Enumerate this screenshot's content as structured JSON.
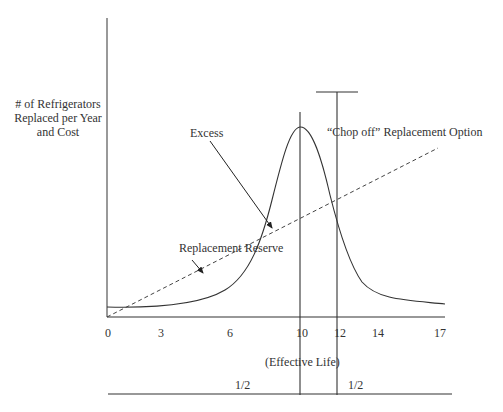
{
  "y_axis_label": {
    "line1": "# of Refrigerators",
    "line2": "Replaced per Year",
    "line3": "and Cost"
  },
  "annotations": {
    "excess": "Excess",
    "chop_off": "“Chop off” Replacement Option",
    "replacement_reserve": "Replacement Reserve",
    "effective_life": "(Effective Life)",
    "half_left": "1/2",
    "half_right": "1/2"
  },
  "x_ticks": [
    {
      "label": "0",
      "x": 108
    },
    {
      "label": "3",
      "x": 161
    },
    {
      "label": "6",
      "x": 230
    },
    {
      "label": "10",
      "x": 302
    },
    {
      "label": "12",
      "x": 340
    },
    {
      "label": "14",
      "x": 378
    },
    {
      "label": "17",
      "x": 440
    }
  ],
  "colors": {
    "line": "#3a3a3a",
    "background": "#ffffff"
  }
}
